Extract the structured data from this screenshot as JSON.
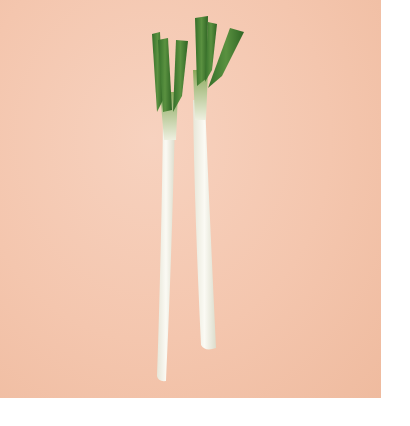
{
  "image": {
    "subject": "two green onions (scallions) on peach background",
    "colors": {
      "background": "#f4c6ae",
      "frame": "#ffffff",
      "stalk_white": "#f3f1e8",
      "leaf_green": "#3f7a2c",
      "leaf_light": "#7fa24a"
    }
  }
}
